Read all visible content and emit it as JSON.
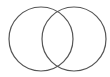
{
  "diagram": {
    "type": "venn",
    "background": "#ffffff",
    "stroke_color": "#555555",
    "stroke_width": 1.2,
    "sets": [
      {
        "name": "circle-left",
        "label": "",
        "cx": 41,
        "cy": 39,
        "r": 32
      },
      {
        "name": "circle-right",
        "label": "",
        "cx": 74,
        "cy": 39,
        "r": 32
      }
    ]
  }
}
